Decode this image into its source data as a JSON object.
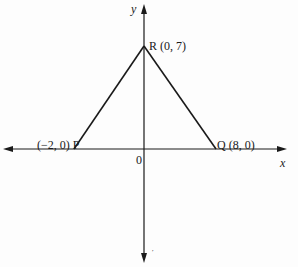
{
  "diagram": {
    "type": "coordinate-plane-triangle",
    "axes": {
      "x_label": "x",
      "y_label": "y",
      "origin_label": "0"
    },
    "points": [
      {
        "name": "R",
        "label": "R (0, 7)",
        "x": 0,
        "y": 7
      },
      {
        "name": "P",
        "label": "(−2, 0) P",
        "x": -2,
        "y": 0
      },
      {
        "name": "Q",
        "label": "Q (8, 0)",
        "x": 8,
        "y": 0
      }
    ],
    "segments": [
      {
        "from": "P",
        "to": "R"
      },
      {
        "from": "R",
        "to": "Q"
      }
    ],
    "stray_mark": "′",
    "colors": {
      "ink": "#1a1a1a",
      "background": "#fdfdfd"
    }
  }
}
